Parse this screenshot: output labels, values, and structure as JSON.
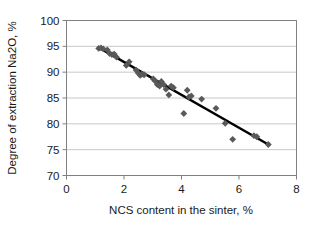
{
  "chart_data": {
    "type": "scatter",
    "title": "",
    "xlabel": "NCS content in the sinter, %",
    "ylabel": "Degree of extraction Na2O, %",
    "xlim": [
      0,
      8
    ],
    "ylim": [
      70,
      100
    ],
    "xticks": [
      "0",
      "2",
      "4",
      "6",
      "8"
    ],
    "xtick_values": [
      0,
      2,
      4,
      6,
      8
    ],
    "yticks": [
      "70",
      "75",
      "80",
      "85",
      "90",
      "95",
      "100"
    ],
    "ytick_values": [
      70,
      75,
      80,
      85,
      90,
      95,
      100
    ],
    "grid": "horizontal",
    "legend": "none",
    "marker": "diamond",
    "marker_color": "#595959",
    "trendline_color": "#000000",
    "gridline_color": "#c8c8c8",
    "axis_color": "#808080",
    "series": [
      {
        "name": "Na2O extraction vs NCS content",
        "points": [
          [
            1.12,
            94.6
          ],
          [
            1.2,
            94.7
          ],
          [
            1.28,
            94.5
          ],
          [
            1.42,
            94.3
          ],
          [
            1.5,
            93.6
          ],
          [
            1.58,
            93.4
          ],
          [
            1.66,
            93.5
          ],
          [
            1.74,
            92.9
          ],
          [
            2.08,
            91.3
          ],
          [
            2.18,
            92.0
          ],
          [
            2.42,
            90.4
          ],
          [
            2.5,
            89.8
          ],
          [
            2.56,
            89.4
          ],
          [
            2.62,
            89.6
          ],
          [
            2.7,
            89.5
          ],
          [
            3.02,
            88.7
          ],
          [
            3.08,
            88.3
          ],
          [
            3.16,
            87.6
          ],
          [
            3.24,
            87.3
          ],
          [
            3.3,
            88.2
          ],
          [
            3.38,
            87.6
          ],
          [
            3.46,
            86.7
          ],
          [
            3.56,
            85.6
          ],
          [
            3.64,
            87.3
          ],
          [
            3.72,
            87.0
          ],
          [
            4.08,
            82.0
          ],
          [
            4.2,
            86.5
          ],
          [
            4.26,
            85.2
          ],
          [
            4.34,
            85.4
          ],
          [
            4.7,
            84.8
          ],
          [
            5.2,
            83.0
          ],
          [
            5.52,
            80.1
          ],
          [
            5.78,
            77.0
          ],
          [
            6.52,
            77.7
          ],
          [
            6.62,
            77.5
          ],
          [
            7.02,
            76.0
          ]
        ]
      }
    ],
    "trendline": {
      "x_start": 1.08,
      "y_start": 94.9,
      "x_end": 7.05,
      "y_end": 75.9
    }
  }
}
